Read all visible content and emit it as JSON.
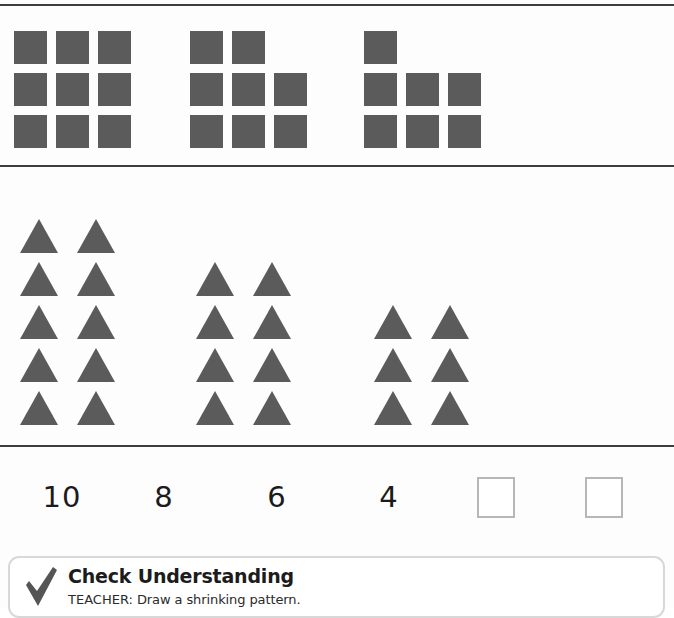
{
  "worksheet": {
    "shape_color": "#5b5b5b",
    "rule_color": "#3d3d3d",
    "dividers": [
      {
        "name": "top-rule"
      },
      {
        "name": "middle-rule"
      },
      {
        "name": "bottom-rule"
      }
    ]
  },
  "square_pattern": {
    "label": "square shrinking pattern",
    "groups": [
      {
        "name": "square-group-1",
        "count": 9,
        "rows": [
          [
            true,
            true,
            true
          ],
          [
            true,
            true,
            true
          ],
          [
            true,
            true,
            true
          ]
        ]
      },
      {
        "name": "square-group-2",
        "count": 8,
        "rows": [
          [
            true,
            true,
            false
          ],
          [
            true,
            true,
            true
          ],
          [
            true,
            true,
            true
          ]
        ]
      },
      {
        "name": "square-group-3",
        "count": 7,
        "rows": [
          [
            true,
            false,
            false
          ],
          [
            true,
            true,
            true
          ],
          [
            true,
            true,
            true
          ]
        ]
      }
    ]
  },
  "triangle_pattern": {
    "label": "triangle shrinking pattern",
    "groups": [
      {
        "name": "triangle-group-1",
        "count": 10,
        "rows": 5,
        "per_row": 2
      },
      {
        "name": "triangle-group-2",
        "count": 8,
        "rows": 4,
        "per_row": 2
      },
      {
        "name": "triangle-group-3",
        "count": 6,
        "rows": 3,
        "per_row": 2
      }
    ]
  },
  "number_pattern": {
    "label": "number shrinking pattern",
    "values": [
      "10",
      "8",
      "6",
      "4"
    ],
    "blanks": 2,
    "blank_labels": [
      "answer-box-1",
      "answer-box-2"
    ]
  },
  "check_understanding": {
    "icon": "checkmark-icon",
    "title": "Check Understanding",
    "teacher_label": "TEACHER:",
    "instruction": " Draw a shrinking pattern."
  }
}
